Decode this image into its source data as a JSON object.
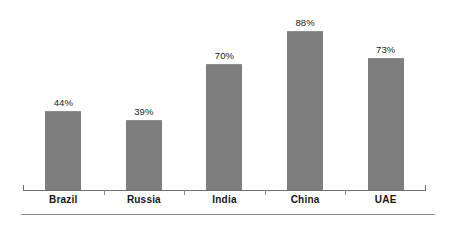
{
  "chart_data": {
    "type": "bar",
    "title": "",
    "subtitle": "",
    "xlabel": "",
    "ylabel": "",
    "ylim": [
      0,
      100
    ],
    "grid": false,
    "legend": "none",
    "orientation": "vertical",
    "value_label_suffix": "%",
    "value_label_position": "above-bar",
    "categories": [
      "Brazil",
      "Russia",
      "India",
      "China",
      "UAE"
    ],
    "values": [
      44,
      39,
      70,
      88,
      73
    ],
    "value_labels": [
      "44%",
      "39%",
      "70%",
      "88%",
      "73%"
    ],
    "series": [
      {
        "name": "",
        "values": [
          44,
          39,
          70,
          88,
          73
        ]
      }
    ],
    "colors": {
      "bar_fill": "#7e7e7e",
      "bar_top_edge": "#8d8d8d",
      "axis_line": "#6f6f6f",
      "tick": "#8a8a8a",
      "label_text": "#171717",
      "value_text": "#1d1d1d",
      "background": "#ffffff",
      "bottom_rule": "#8e8e8e"
    }
  },
  "axis": {
    "baseline_visible": true,
    "endcaps": [
      "left",
      "right"
    ],
    "tick_count": 4
  }
}
